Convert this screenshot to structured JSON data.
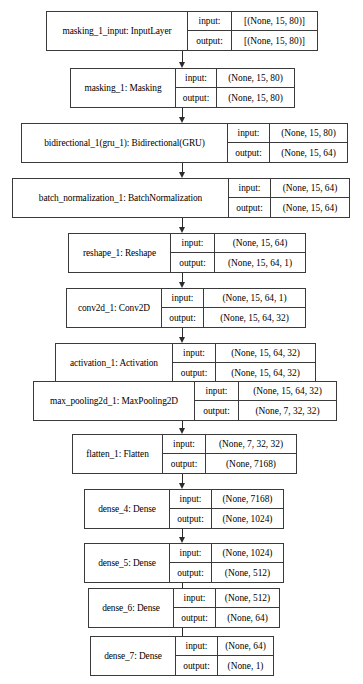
{
  "diagram": {
    "io_labels": {
      "input": "input:",
      "output": "output:"
    },
    "arrow_x": 182,
    "layers": [
      {
        "id": "masking_1_input",
        "name": "masking_1_input: InputLayer",
        "input_shape": "[(None, 15, 80)]",
        "output_shape": "[(None, 15, 80)]",
        "x": 46,
        "y": 11,
        "width": 272,
        "name_width": 141,
        "label_width": 44
      },
      {
        "id": "masking_1",
        "name": "masking_1: Masking",
        "input_shape": "(None, 15, 80)",
        "output_shape": "(None, 15, 80)",
        "x": 70,
        "y": 68,
        "width": 225,
        "name_width": 105,
        "label_width": 41
      },
      {
        "id": "bidirectional_1",
        "name": "bidirectional_1(gru_1): Bidirectional(GRU)",
        "input_shape": "(None, 15, 80)",
        "output_shape": "(None, 15, 64)",
        "x": 21,
        "y": 123,
        "width": 327,
        "name_width": 206,
        "label_width": 42
      },
      {
        "id": "batch_normalization_1",
        "name": "batch_normalization_1: BatchNormalization",
        "input_shape": "(None, 15, 64)",
        "output_shape": "(None, 15, 64)",
        "x": 12,
        "y": 178,
        "width": 338,
        "name_width": 216,
        "label_width": 42
      },
      {
        "id": "reshape_1",
        "name": "reshape_1: Reshape",
        "input_shape": "(None, 15, 64)",
        "output_shape": "(None, 15, 64, 1)",
        "x": 68,
        "y": 233,
        "width": 238,
        "name_width": 102,
        "label_width": 44
      },
      {
        "id": "conv2d_1",
        "name": "conv2d_1: Conv2D",
        "input_shape": "(None, 15, 64, 1)",
        "output_shape": "(None, 15, 64, 32)",
        "x": 66,
        "y": 288,
        "width": 240,
        "name_width": 95,
        "label_width": 42
      },
      {
        "id": "activation_1",
        "name": "activation_1: Activation",
        "input_shape": "(None, 15, 64, 32)",
        "output_shape": "(None, 15, 64, 32)",
        "x": 55,
        "y": 343,
        "width": 261,
        "name_width": 117,
        "label_width": 43
      },
      {
        "id": "max_pooling2d_1",
        "name": "max_pooling2d_1: MaxPooling2D",
        "input_shape": "(None, 15, 64, 32)",
        "output_shape": "(None, 7, 32, 32)",
        "x": 33,
        "y": 381,
        "width": 304,
        "name_width": 161,
        "label_width": 44
      },
      {
        "id": "flatten_1",
        "name": "flatten_1: Flatten",
        "input_shape": "(None, 7, 32, 32)",
        "output_shape": "(None, 7168)",
        "x": 72,
        "y": 434,
        "width": 225,
        "name_width": 90,
        "label_width": 43
      },
      {
        "id": "dense_4",
        "name": "dense_4: Dense",
        "input_shape": "(None, 7168)",
        "output_shape": "(None, 1024)",
        "x": 84,
        "y": 489,
        "width": 200,
        "name_width": 85,
        "label_width": 42
      },
      {
        "id": "dense_5",
        "name": "dense_5: Dense",
        "input_shape": "(None, 1024)",
        "output_shape": "(None, 512)",
        "x": 84,
        "y": 543,
        "width": 200,
        "name_width": 85,
        "label_width": 42
      },
      {
        "id": "dense_6",
        "name": "dense_6: Dense",
        "input_shape": "(None, 512)",
        "output_shape": "(None, 64)",
        "x": 88,
        "y": 588,
        "width": 192,
        "name_width": 85,
        "label_width": 42
      },
      {
        "id": "dense_7",
        "name": "dense_7: Dense",
        "input_shape": "(None, 64)",
        "output_shape": "(None, 1)",
        "x": 90,
        "y": 636,
        "width": 184,
        "name_width": 85,
        "label_width": 42
      }
    ],
    "edges": [
      {
        "from": "masking_1_input",
        "to": "masking_1",
        "y": 51,
        "height": 17
      },
      {
        "from": "masking_1",
        "to": "bidirectional_1",
        "y": 108,
        "height": 15
      },
      {
        "from": "bidirectional_1",
        "to": "batch_normalization_1",
        "y": 163,
        "height": 15
      },
      {
        "from": "batch_normalization_1",
        "to": "reshape_1",
        "y": 218,
        "height": 15
      },
      {
        "from": "reshape_1",
        "to": "conv2d_1",
        "y": 273,
        "height": 15
      },
      {
        "from": "conv2d_1",
        "to": "activation_1",
        "y": 328,
        "height": 15
      },
      {
        "from": "activation_1",
        "to": "max_pooling2d_1",
        "y": 383,
        "height": 18
      },
      {
        "from": "max_pooling2d_1",
        "to": "flatten_1",
        "y": 421,
        "height": 13
      },
      {
        "from": "flatten_1",
        "to": "dense_4",
        "y": 474,
        "height": 15
      },
      {
        "from": "dense_4",
        "to": "dense_5",
        "y": 529,
        "height": 14
      },
      {
        "from": "dense_5",
        "to": "dense_6",
        "y": 583,
        "height": 15
      },
      {
        "from": "dense_6",
        "to": "dense_7",
        "y": 628,
        "height": 18
      }
    ]
  }
}
